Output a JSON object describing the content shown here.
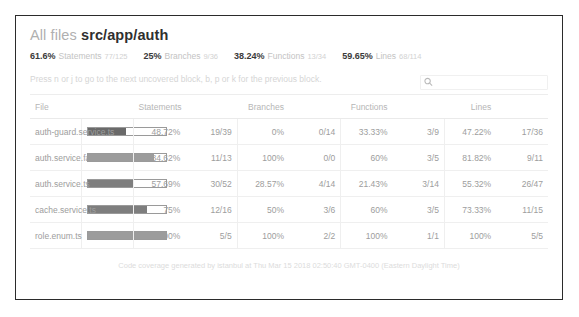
{
  "header": {
    "breadcrumb_root": "All files",
    "breadcrumb_current": "src/app/auth",
    "summary": [
      {
        "pct": "61.6%",
        "name": "Statements",
        "fraction": "77/125",
        "key": "statements"
      },
      {
        "pct": "25%",
        "name": "Branches",
        "fraction": "9/36",
        "key": "branches"
      },
      {
        "pct": "38.24%",
        "name": "Functions",
        "fraction": "13/34",
        "key": "functions"
      },
      {
        "pct": "59.65%",
        "name": "Lines",
        "fraction": "68/114",
        "key": "lines"
      }
    ],
    "keyboard_hint": "Press n or j to go to the next uncovered block, b, p or k for the previous block.",
    "search_placeholder": "",
    "search_value": "",
    "search_icon": "search-icon"
  },
  "table": {
    "columns": [
      {
        "label": "File",
        "key": "file"
      },
      {
        "label": "",
        "key": "statements_bar"
      },
      {
        "label": "Statements",
        "key": "statements_pct"
      },
      {
        "label": "",
        "key": "statements_abs"
      },
      {
        "label": "Branches",
        "key": "branches_pct"
      },
      {
        "label": "",
        "key": "branches_abs"
      },
      {
        "label": "Functions",
        "key": "functions_pct"
      },
      {
        "label": "",
        "key": "functions_abs"
      },
      {
        "label": "Lines",
        "key": "lines_pct"
      },
      {
        "label": "",
        "key": "lines_abs"
      }
    ],
    "rows": [
      {
        "file": "auth-guard.service.ts",
        "bar_pct": 48.72,
        "bar_level": "low",
        "statements_pct": "48.72%",
        "statements_abs": "19/39",
        "branches_pct": "0%",
        "branches_abs": "0/14",
        "functions_pct": "33.33%",
        "functions_abs": "3/9",
        "lines_pct": "47.22%",
        "lines_abs": "17/36"
      },
      {
        "file": "auth.service.fake.ts",
        "bar_pct": 84.62,
        "bar_level": "high",
        "statements_pct": "84.62%",
        "statements_abs": "11/13",
        "branches_pct": "100%",
        "branches_abs": "0/0",
        "functions_pct": "60%",
        "functions_abs": "3/5",
        "lines_pct": "81.82%",
        "lines_abs": "9/11"
      },
      {
        "file": "auth.service.ts",
        "bar_pct": 57.69,
        "bar_level": "medium",
        "statements_pct": "57.69%",
        "statements_abs": "30/52",
        "branches_pct": "28.57%",
        "branches_abs": "4/14",
        "functions_pct": "21.43%",
        "functions_abs": "3/14",
        "lines_pct": "55.32%",
        "lines_abs": "26/47"
      },
      {
        "file": "cache.service.ts",
        "bar_pct": 75,
        "bar_level": "medium",
        "statements_pct": "75%",
        "statements_abs": "12/16",
        "branches_pct": "50%",
        "branches_abs": "3/6",
        "functions_pct": "60%",
        "functions_abs": "3/5",
        "lines_pct": "73.33%",
        "lines_abs": "11/15"
      },
      {
        "file": "role.enum.ts",
        "bar_pct": 100,
        "bar_level": "high",
        "statements_pct": "100%",
        "statements_abs": "5/5",
        "branches_pct": "100%",
        "branches_abs": "2/2",
        "functions_pct": "100%",
        "functions_abs": "1/1",
        "lines_pct": "100%",
        "lines_abs": "5/5"
      }
    ]
  },
  "footer": {
    "text": "Code coverage generated by istanbul at Thu Mar 15 2018 02:50:40 GMT-0400 (Eastern Daylight Time)"
  },
  "colors": {
    "frame_border": "#2b2b2b",
    "title_muted": "#b0b0b0",
    "title_strong": "#2f2f2f",
    "bar_fill": "#6f6f6f",
    "bar_track_border": "#9a9a9a",
    "muted_text": "#9d9d9d"
  }
}
